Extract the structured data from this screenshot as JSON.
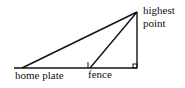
{
  "diagram": {
    "type": "right-triangle geometry",
    "labels": {
      "home_plate": "home plate",
      "fence": "fence",
      "highest_point_line1": "highest",
      "highest_point_line2": "point"
    },
    "points": {
      "home_plate": [
        22,
        68
      ],
      "fence": [
        90,
        68
      ],
      "foot": [
        137,
        68
      ],
      "highest_point": [
        137,
        12
      ]
    },
    "line_color": "#111111"
  }
}
